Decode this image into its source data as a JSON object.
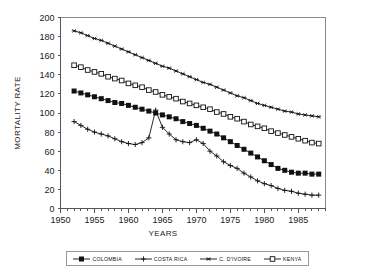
{
  "chart_data": {
    "type": "line",
    "title": "",
    "xlabel": "YEARS",
    "ylabel": "MORTALITY RATE",
    "xlim": [
      1950,
      1989
    ],
    "ylim": [
      0,
      200
    ],
    "yticks": [
      0,
      20,
      40,
      60,
      80,
      100,
      120,
      140,
      160,
      180,
      200
    ],
    "xticks": [
      1950,
      1955,
      1960,
      1965,
      1970,
      1975,
      1980,
      1985
    ],
    "xtick_minor_step": 1,
    "grid": false,
    "legend_position": "bottom",
    "x": [
      1952,
      1953,
      1954,
      1955,
      1956,
      1957,
      1958,
      1959,
      1960,
      1961,
      1962,
      1963,
      1964,
      1965,
      1966,
      1967,
      1968,
      1969,
      1970,
      1971,
      1972,
      1973,
      1974,
      1975,
      1976,
      1977,
      1978,
      1979,
      1980,
      1981,
      1982,
      1983,
      1984,
      1985,
      1986,
      1987,
      1988
    ],
    "series": [
      {
        "name": "COLOMBIA",
        "marker": "filled-square",
        "values": [
          123,
          121,
          119,
          117,
          115,
          113,
          111,
          110,
          108,
          106,
          104,
          102,
          100,
          98,
          96,
          94,
          91,
          89,
          87,
          84,
          81,
          78,
          74,
          70,
          66,
          62,
          58,
          54,
          50,
          46,
          42,
          40,
          38,
          37,
          37,
          36,
          36
        ]
      },
      {
        "name": "COSTA RICA",
        "marker": "cross",
        "values": [
          91,
          87,
          83,
          80,
          78,
          76,
          73,
          70,
          68,
          67,
          69,
          74,
          103,
          85,
          78,
          72,
          70,
          69,
          72,
          68,
          60,
          55,
          49,
          45,
          42,
          37,
          33,
          29,
          26,
          24,
          21,
          19,
          18,
          16,
          15,
          14,
          14
        ]
      },
      {
        "name": "C. D'IVOIRE",
        "marker": "star",
        "values": [
          186,
          184,
          181,
          178,
          176,
          173,
          170,
          167,
          164,
          161,
          158,
          155,
          152,
          149,
          147,
          144,
          141,
          138,
          135,
          132,
          130,
          127,
          124,
          121,
          118,
          116,
          113,
          110,
          108,
          106,
          104,
          102,
          101,
          99,
          98,
          97,
          96
        ]
      },
      {
        "name": "KENYA",
        "marker": "open-square",
        "values": [
          150,
          148,
          145,
          143,
          141,
          138,
          136,
          134,
          131,
          129,
          127,
          124,
          122,
          119,
          117,
          115,
          112,
          110,
          108,
          106,
          104,
          101,
          99,
          96,
          94,
          91,
          88,
          86,
          84,
          81,
          79,
          77,
          75,
          73,
          71,
          69,
          68
        ]
      }
    ]
  },
  "legend": {
    "entries": [
      {
        "label": "COLOMBIA",
        "marker": "filled-square"
      },
      {
        "label": "COSTA RICA",
        "marker": "cross"
      },
      {
        "label": "C. D'IVOIRE",
        "marker": "star"
      },
      {
        "label": "KENYA",
        "marker": "open-square"
      }
    ]
  }
}
